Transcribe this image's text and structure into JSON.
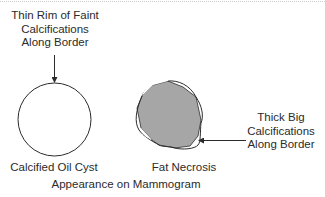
{
  "diagram": {
    "title": "Appearance on Mammogram",
    "items": [
      {
        "label": "Calcified Oil Cyst",
        "callout": [
          "Thin Rim of Faint",
          "Calcifications",
          "Along Border"
        ]
      },
      {
        "label": "Fat Necrosis",
        "callout": [
          "Thick Big",
          "Calcifications",
          "Along Border"
        ]
      }
    ],
    "colors": {
      "stroke": "#2b2b2b",
      "fill_necrosis": "#a6a6a6",
      "background": "#ffffff"
    }
  }
}
